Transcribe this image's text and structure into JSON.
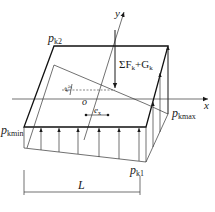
{
  "diagram": {
    "type": "foundation-base-pressure-distribution",
    "labels": {
      "p_k2": {
        "main": "p",
        "sub": "k2"
      },
      "p_kmin": {
        "main": "p",
        "sub": "kmin"
      },
      "p_kmax": {
        "main": "p",
        "sub": "kmax"
      },
      "p_k1": {
        "main": "p",
        "sub": "k1"
      },
      "load": {
        "prefix": "ΣF",
        "sub1": "k",
        "plus": "+G",
        "sub2": "k"
      },
      "axis_x": "x",
      "axis_y": "y",
      "origin": "o",
      "ecc_x": {
        "main": "e",
        "sub": "x"
      },
      "ecc_y": {
        "main": "e",
        "sub": "y"
      },
      "length": "L"
    },
    "colors": {
      "line": "#1a1a1a",
      "background": "#ffffff"
    }
  }
}
